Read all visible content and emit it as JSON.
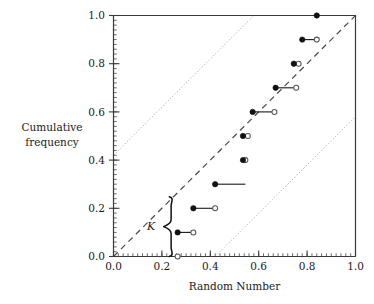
{
  "chart_data": {
    "type": "scatter",
    "title": "",
    "xlabel": "Random Number",
    "ylabel_lines": [
      "Cumulative",
      "frequency"
    ],
    "xlim": [
      0.0,
      1.0
    ],
    "ylim": [
      0.0,
      1.0
    ],
    "grid": false,
    "legend_position": "none",
    "xticks": [
      0.0,
      0.2,
      0.4,
      0.6,
      0.8,
      1.0
    ],
    "xticklabels": [
      "0.0",
      "0.2",
      "0.4",
      "0.6",
      "0.8",
      "1.0"
    ],
    "yticks": [
      0.0,
      0.2,
      0.4,
      0.6,
      0.8,
      1.0
    ],
    "yticklabels": [
      "0.0",
      "0.2",
      "0.4",
      "0.6",
      "0.8",
      "1.0"
    ],
    "minor_tick_step": 0.02,
    "series": [
      {
        "name": "sample values (filled circles)",
        "marker": "filled-circle",
        "x": [
          0.265,
          0.33,
          0.42,
          0.535,
          0.535,
          0.575,
          0.67,
          0.745,
          0.78,
          0.84
        ],
        "y": [
          0.1,
          0.2,
          0.3,
          0.4,
          0.5,
          0.6,
          0.7,
          0.8,
          0.9,
          1.0
        ]
      },
      {
        "name": "theoretical values (open circles)",
        "marker": "open-circle",
        "x": [
          0.265,
          0.33,
          0.42,
          0.545,
          0.555,
          0.665,
          0.755,
          0.765,
          0.84
        ],
        "y": [
          0.0,
          0.1,
          0.2,
          0.4,
          0.5,
          0.6,
          0.7,
          0.8,
          0.9
        ]
      }
    ],
    "connectors": [
      {
        "y": 0.1,
        "x_from": 0.265,
        "x_to": 0.33
      },
      {
        "y": 0.2,
        "x_from": 0.33,
        "x_to": 0.42
      },
      {
        "y": 0.3,
        "x_from": 0.42,
        "x_to": 0.545
      },
      {
        "y": 0.4,
        "x_from": 0.535,
        "x_to": 0.545
      },
      {
        "y": 0.5,
        "x_from": 0.535,
        "x_to": 0.555
      },
      {
        "y": 0.6,
        "x_from": 0.575,
        "x_to": 0.665
      },
      {
        "y": 0.7,
        "x_from": 0.67,
        "x_to": 0.755
      },
      {
        "y": 0.8,
        "x_from": 0.745,
        "x_to": 0.765
      },
      {
        "y": 0.9,
        "x_from": 0.78,
        "x_to": 0.84
      }
    ],
    "reference_line": {
      "name": "1:1 diagonal",
      "style": "dashed",
      "from": [
        0.0,
        0.0
      ],
      "to": [
        1.0,
        1.0
      ]
    },
    "band_lines": [
      {
        "name": "upper confidence band",
        "style": "dotted",
        "from": [
          0.0,
          0.42
        ],
        "to": [
          0.58,
          1.0
        ]
      },
      {
        "name": "lower confidence band",
        "style": "dotted",
        "from": [
          0.42,
          0.0
        ],
        "to": [
          1.0,
          0.58
        ]
      }
    ],
    "annotation": {
      "label": "K",
      "type": "curly-brace",
      "brace_x": 0.235,
      "brace_y_from": 0.0,
      "brace_y_to": 0.248,
      "label_x": 0.155,
      "label_y": 0.128
    },
    "colors": {
      "axis": "#3a3a3a",
      "marker_filled": "#111111",
      "marker_open_edge": "#555555",
      "connector": "#222222",
      "reference_line": "#4d4d4d",
      "band_line": "#9a9a9a",
      "brace": "#111111",
      "background": "#ffffff"
    }
  }
}
